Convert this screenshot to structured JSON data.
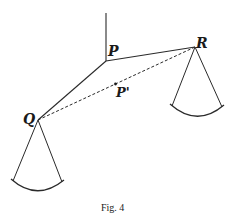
{
  "figure": {
    "caption": "Fig. 4",
    "labels": {
      "P": "P",
      "R": "R",
      "Q": "Q",
      "P_prime": "P'"
    },
    "points": {
      "support_top": [
        106,
        13
      ],
      "P": [
        106,
        61
      ],
      "R": [
        195,
        47
      ],
      "Q": [
        38,
        120
      ],
      "P_prime": [
        115.5,
        84
      ]
    },
    "pans": [
      {
        "name": "pan-R",
        "apex": [
          195,
          47
        ],
        "left": [
          172,
          106
        ],
        "right": [
          222,
          107
        ],
        "arc_low": [
          197,
          117
        ]
      },
      {
        "name": "pan-Q",
        "apex": [
          38,
          120
        ],
        "left": [
          13,
          181
        ],
        "right": [
          62,
          182
        ],
        "arc_low": [
          37,
          191
        ]
      }
    ],
    "colors": {
      "line": "#2a2a2a",
      "background": "#ffffff"
    }
  }
}
